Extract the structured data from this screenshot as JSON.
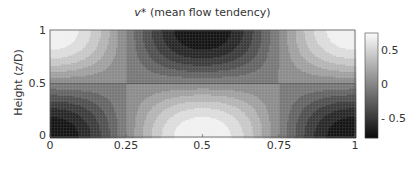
{
  "chart_data": {
    "type": "heatmap",
    "title": "v* (mean flow tendency)",
    "title_symbol": "v*",
    "title_text": "(mean flow tendency)",
    "xlabel": "",
    "ylabel": "Height (z/D)",
    "xlim": [
      0,
      1
    ],
    "ylim": [
      0,
      1
    ],
    "x_ticks": [
      0,
      0.25,
      0.5,
      0.75,
      1
    ],
    "x_tick_labels": [
      "0",
      "0.25",
      "0.5",
      "0.75",
      "1"
    ],
    "y_ticks": [
      0,
      0.5,
      1
    ],
    "y_tick_labels": [
      "0",
      "0.5",
      "1"
    ],
    "colorbar": {
      "range": [
        -0.75,
        0.75
      ],
      "ticks": [
        0.5,
        0,
        -0.5
      ],
      "tick_labels": [
        "0.5",
        "0",
        "- 0.5"
      ],
      "colormap": "gray"
    },
    "field_description": "v* ≈ -cos(2πx)·cos(πz): negative (dark) at top-center and bottom corners, positive (light) at bottom-center and top corners; zero contours at z=0.5 and x=0.25, 0.75",
    "field_formula": {
      "amplitude": 0.75,
      "kx": 2,
      "kz": 1
    },
    "contour_levels": 12,
    "grid": false
  }
}
